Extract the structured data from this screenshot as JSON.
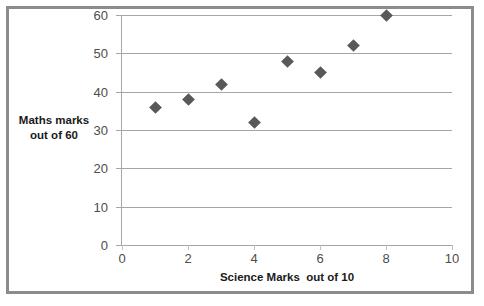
{
  "chart_data": {
    "type": "scatter",
    "title": "",
    "xlabel": "Science Marks  out of 10",
    "ylabel_line1": "Maths marks",
    "ylabel_line2": "out of 60",
    "xlim": [
      0,
      10
    ],
    "ylim": [
      0,
      60
    ],
    "xticks": [
      "0",
      "2",
      "4",
      "6",
      "8",
      "10"
    ],
    "xtick_values": [
      0,
      2,
      4,
      6,
      8,
      10
    ],
    "yticks": [
      "0",
      "10",
      "20",
      "30",
      "40",
      "50",
      "60"
    ],
    "ytick_values": [
      0,
      10,
      20,
      30,
      40,
      50,
      60
    ],
    "grid": "horizontal",
    "legend": "none",
    "marker_shape": "diamond",
    "marker_color": "#595959",
    "gridline_color": "#a6a6a6",
    "frame_color": "#8c8c8c",
    "background_color": "#ffffff",
    "points": [
      {
        "x": 1,
        "y": 36
      },
      {
        "x": 2,
        "y": 38
      },
      {
        "x": 3,
        "y": 42
      },
      {
        "x": 4,
        "y": 32
      },
      {
        "x": 5,
        "y": 48
      },
      {
        "x": 6,
        "y": 45
      },
      {
        "x": 7,
        "y": 52
      },
      {
        "x": 8,
        "y": 60
      }
    ]
  }
}
